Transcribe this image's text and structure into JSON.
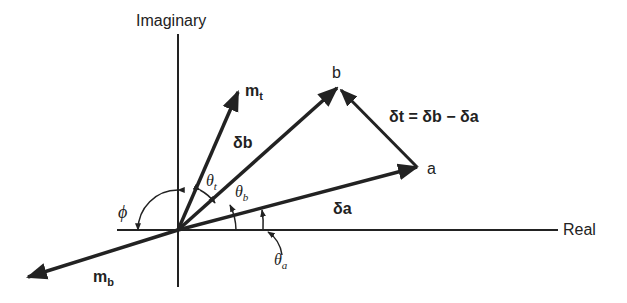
{
  "diagram": {
    "axes": {
      "vertical_label": "Imaginary",
      "horizontal_label": "Real"
    },
    "vectors": [
      {
        "name": "m_t",
        "label": "m",
        "sub": "t"
      },
      {
        "name": "b",
        "label": "b"
      },
      {
        "name": "a",
        "label": "a"
      },
      {
        "name": "m_b",
        "label": "m",
        "sub": "b"
      },
      {
        "name": "delta_b",
        "label": "δb"
      },
      {
        "name": "delta_a",
        "label": "δa"
      }
    ],
    "equation": "δt = δb − δa",
    "angles": {
      "phi": "ϕ",
      "theta_t": {
        "sym": "θ",
        "sub": "t"
      },
      "theta_b": {
        "sym": "θ",
        "sub": "b"
      },
      "theta_a": {
        "sym": "θ",
        "sub": "a"
      }
    }
  }
}
